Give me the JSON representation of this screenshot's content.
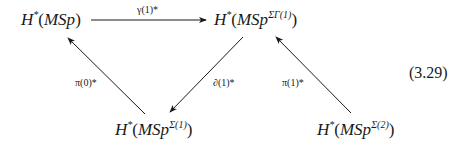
{
  "diagram": {
    "nodes": [
      {
        "id": "top-left",
        "H": "H",
        "star": "*",
        "open": "(",
        "base": "MSp",
        "sup": "",
        "close": ")",
        "text": "H*(MSp)"
      },
      {
        "id": "top-right",
        "H": "H",
        "star": "*",
        "open": "(",
        "base": "MSp",
        "sup": "ΣΓ(1)",
        "close": ")",
        "text": "H*(MSp^{ΣΓ(1)})"
      },
      {
        "id": "bottom-left",
        "H": "H",
        "star": "*",
        "open": "(",
        "base": "MSp",
        "sup": "Σ(1)",
        "close": ")",
        "text": "H*(MSp^{Σ(1)})"
      },
      {
        "id": "bottom-right",
        "H": "H",
        "star": "*",
        "open": "(",
        "base": "MSp",
        "sup": "Σ(2)",
        "close": ")",
        "text": "H*(MSp^{Σ(2)})"
      }
    ],
    "arrows": [
      {
        "from": "top-left",
        "to": "top-right",
        "label": "γ(1)*"
      },
      {
        "from": "bottom-left",
        "to": "top-left",
        "label": "π(0)*"
      },
      {
        "from": "top-right",
        "to": "bottom-left",
        "label": "∂(1)*"
      },
      {
        "from": "bottom-right",
        "to": "top-right",
        "label": "π(1)*"
      }
    ],
    "equation_number": "(3.29)"
  }
}
